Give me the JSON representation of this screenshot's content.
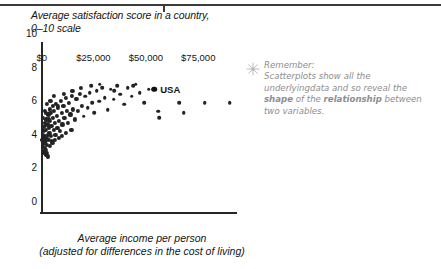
{
  "figure": {
    "title_line1": "Average satisfaction score in a country,",
    "title_line2": "0–10 scale",
    "x_caption_line1": "Average income per person",
    "x_caption_line2": "(adjusted for differences in the cost of living)"
  },
  "note": {
    "icon": "sparkle-icon",
    "heading": "Remember:",
    "line1_a": "Scatterplots show ",
    "line1_em": "all",
    "line1_b": " the underlying",
    "line2_a": "data and so reveal the ",
    "line2_b": "shape",
    "line2_c": " of the",
    "line3_a": "relationship",
    "line3_b": " between two variables."
  },
  "chart_data": {
    "type": "scatter",
    "title": "Average satisfaction score in a country, 0–10 scale",
    "xlabel": "Average income per person (adjusted for differences in the cost of living)",
    "ylabel": "Average satisfaction score in a country, 0–10 scale",
    "xlim": [
      0,
      93000
    ],
    "ylim": [
      0,
      10
    ],
    "xticks": [
      0,
      25000,
      50000,
      75000
    ],
    "xtick_labels": [
      "$0",
      "$25,000",
      "$50,000",
      "$75,000"
    ],
    "yticks": [
      0,
      2,
      4,
      6,
      8,
      10
    ],
    "ytick_labels": [
      "0",
      "2",
      "4",
      "6",
      "8",
      "10"
    ],
    "grid": false,
    "legend": false,
    "marker_color": "#232323",
    "annotations": [
      {
        "label": "USA",
        "x": 54000,
        "y": 7.3
      }
    ],
    "points": [
      {
        "x": 700,
        "y": 4.3
      },
      {
        "x": 900,
        "y": 3.9
      },
      {
        "x": 1000,
        "y": 4.6
      },
      {
        "x": 1100,
        "y": 5.0
      },
      {
        "x": 1200,
        "y": 3.6
      },
      {
        "x": 1300,
        "y": 4.4
      },
      {
        "x": 1500,
        "y": 4.8
      },
      {
        "x": 1600,
        "y": 4.1
      },
      {
        "x": 1700,
        "y": 5.3
      },
      {
        "x": 1800,
        "y": 3.8
      },
      {
        "x": 1900,
        "y": 4.5
      },
      {
        "x": 2000,
        "y": 5.1
      },
      {
        "x": 2100,
        "y": 4.2
      },
      {
        "x": 2300,
        "y": 4.9
      },
      {
        "x": 2400,
        "y": 3.7
      },
      {
        "x": 2600,
        "y": 5.5
      },
      {
        "x": 2700,
        "y": 4.4
      },
      {
        "x": 2900,
        "y": 4.0
      },
      {
        "x": 3100,
        "y": 5.2
      },
      {
        "x": 3300,
        "y": 4.6
      },
      {
        "x": 3500,
        "y": 5.8
      },
      {
        "x": 3600,
        "y": 4.3
      },
      {
        "x": 3800,
        "y": 5.0
      },
      {
        "x": 4000,
        "y": 4.7
      },
      {
        "x": 4200,
        "y": 6.1
      },
      {
        "x": 4400,
        "y": 5.4
      },
      {
        "x": 4600,
        "y": 4.5
      },
      {
        "x": 4800,
        "y": 5.9
      },
      {
        "x": 5000,
        "y": 5.1
      },
      {
        "x": 5200,
        "y": 4.2
      },
      {
        "x": 5500,
        "y": 6.3
      },
      {
        "x": 5800,
        "y": 5.6
      },
      {
        "x": 6000,
        "y": 4.9
      },
      {
        "x": 6300,
        "y": 6.0
      },
      {
        "x": 6600,
        "y": 5.3
      },
      {
        "x": 6900,
        "y": 4.6
      },
      {
        "x": 7200,
        "y": 6.4
      },
      {
        "x": 7500,
        "y": 5.7
      },
      {
        "x": 7800,
        "y": 5.0
      },
      {
        "x": 8200,
        "y": 6.2
      },
      {
        "x": 8600,
        "y": 5.4
      },
      {
        "x": 9000,
        "y": 4.8
      },
      {
        "x": 9400,
        "y": 6.6
      },
      {
        "x": 9800,
        "y": 5.9
      },
      {
        "x": 10200,
        "y": 5.2
      },
      {
        "x": 10700,
        "y": 6.3
      },
      {
        "x": 11200,
        "y": 5.6
      },
      {
        "x": 11700,
        "y": 6.8
      },
      {
        "x": 12200,
        "y": 6.0
      },
      {
        "x": 12800,
        "y": 5.3
      },
      {
        "x": 13400,
        "y": 6.5
      },
      {
        "x": 14000,
        "y": 5.8
      },
      {
        "x": 14700,
        "y": 6.9
      },
      {
        "x": 15400,
        "y": 6.1
      },
      {
        "x": 16100,
        "y": 5.5
      },
      {
        "x": 16900,
        "y": 6.7
      },
      {
        "x": 17700,
        "y": 6.0
      },
      {
        "x": 18500,
        "y": 7.0
      },
      {
        "x": 19400,
        "y": 6.3
      },
      {
        "x": 20300,
        "y": 5.7
      },
      {
        "x": 21200,
        "y": 6.9
      },
      {
        "x": 22200,
        "y": 6.2
      },
      {
        "x": 23200,
        "y": 7.1
      },
      {
        "x": 24300,
        "y": 6.5
      },
      {
        "x": 25400,
        "y": 5.9
      },
      {
        "x": 26600,
        "y": 7.2
      },
      {
        "x": 27800,
        "y": 6.6
      },
      {
        "x": 29100,
        "y": 7.4
      },
      {
        "x": 30400,
        "y": 6.8
      },
      {
        "x": 31800,
        "y": 6.1
      },
      {
        "x": 33200,
        "y": 7.3
      },
      {
        "x": 34700,
        "y": 6.7
      },
      {
        "x": 36300,
        "y": 7.5
      },
      {
        "x": 37900,
        "y": 7.0
      },
      {
        "x": 39600,
        "y": 6.4
      },
      {
        "x": 41400,
        "y": 7.4
      },
      {
        "x": 43200,
        "y": 6.9
      },
      {
        "x": 45100,
        "y": 7.6
      },
      {
        "x": 47100,
        "y": 7.1
      },
      {
        "x": 49200,
        "y": 6.5
      },
      {
        "x": 51400,
        "y": 7.3
      },
      {
        "x": 54000,
        "y": 7.3
      },
      {
        "x": 56000,
        "y": 6.0
      },
      {
        "x": 56500,
        "y": 5.6
      },
      {
        "x": 66000,
        "y": 6.5
      },
      {
        "x": 68000,
        "y": 5.9
      },
      {
        "x": 78000,
        "y": 6.5
      },
      {
        "x": 90000,
        "y": 6.5
      },
      {
        "x": 2200,
        "y": 3.4
      },
      {
        "x": 2800,
        "y": 3.5
      },
      {
        "x": 3400,
        "y": 3.3
      },
      {
        "x": 1400,
        "y": 3.5
      },
      {
        "x": 4100,
        "y": 3.9
      },
      {
        "x": 5400,
        "y": 4.1
      },
      {
        "x": 6800,
        "y": 4.3
      },
      {
        "x": 8400,
        "y": 4.4
      },
      {
        "x": 10000,
        "y": 4.5
      },
      {
        "x": 12000,
        "y": 4.7
      },
      {
        "x": 14500,
        "y": 4.9
      },
      {
        "x": 3000,
        "y": 6.4
      },
      {
        "x": 4500,
        "y": 6.6
      },
      {
        "x": 6200,
        "y": 6.9
      },
      {
        "x": 8000,
        "y": 6.3
      },
      {
        "x": 11000,
        "y": 7.0
      },
      {
        "x": 15000,
        "y": 7.2
      },
      {
        "x": 19000,
        "y": 7.4
      },
      {
        "x": 24000,
        "y": 7.5
      },
      {
        "x": 28000,
        "y": 7.6
      },
      {
        "x": 35000,
        "y": 7.2
      },
      {
        "x": 44000,
        "y": 7.5
      },
      {
        "x": 1000,
        "y": 5.6
      },
      {
        "x": 1800,
        "y": 6.0
      },
      {
        "x": 2500,
        "y": 5.9
      },
      {
        "x": 3900,
        "y": 5.5
      }
    ]
  }
}
